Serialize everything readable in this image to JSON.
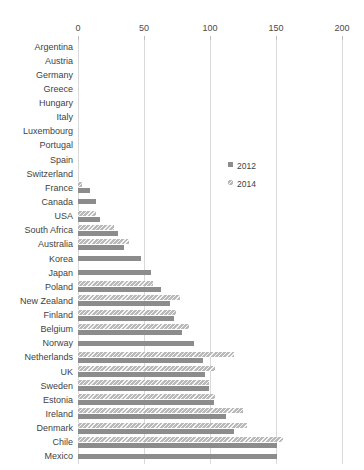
{
  "chart_data": {
    "type": "bar",
    "orientation": "horizontal",
    "title": "",
    "xlabel": "",
    "ylabel": "",
    "xlim": [
      0,
      200
    ],
    "xticks": [
      0,
      50,
      100,
      150,
      200
    ],
    "grid": true,
    "legend_position": "center-right",
    "categories": [
      "Argentina",
      "Austria",
      "Germany",
      "Greece",
      "Hungary",
      "Italy",
      "Luxembourg",
      "Portugal",
      "Spain",
      "Switzerland",
      "France",
      "Canada",
      "USA",
      "South Africa",
      "Australia",
      "Korea",
      "Japan",
      "Poland",
      "New Zealand",
      "Finland",
      "Belgium",
      "Norway",
      "Netherlands",
      "UK",
      "Sweden",
      "Estonia",
      "Ireland",
      "Denmark",
      "Chile",
      "Mexico"
    ],
    "series": [
      {
        "name": "2012",
        "color": "#8c8c8c",
        "values": [
          0,
          0,
          0,
          0,
          0,
          0,
          0,
          0,
          0,
          0,
          9,
          14,
          17,
          30,
          35,
          48,
          55,
          63,
          70,
          73,
          79,
          88,
          95,
          96,
          99,
          103,
          112,
          118,
          151,
          151
        ]
      },
      {
        "name": "2014",
        "color": "#b9b9b9",
        "values": [
          0,
          0,
          0,
          0,
          0,
          0,
          0,
          0,
          0,
          0,
          3,
          0,
          14,
          27,
          39,
          0,
          0,
          57,
          77,
          74,
          84,
          0,
          118,
          104,
          99,
          104,
          125,
          128,
          155,
          0
        ]
      }
    ]
  },
  "legend": {
    "items": [
      {
        "label": "2012",
        "swatch": "solid-gray-swatch"
      },
      {
        "label": "2014",
        "swatch": "hatched-gray-swatch"
      }
    ]
  },
  "axis": {
    "tick_labels": [
      "0",
      "50",
      "100",
      "150",
      "200"
    ]
  }
}
